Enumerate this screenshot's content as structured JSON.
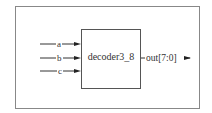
{
  "diagram": {
    "module": {
      "name": "decoder3_8"
    },
    "inputs": [
      {
        "label": "a"
      },
      {
        "label": "b"
      },
      {
        "label": "c"
      }
    ],
    "outputs": [
      {
        "label": "out[7:0]"
      }
    ],
    "colors": {
      "line": "#333333",
      "frame": "#888888",
      "background": "#ffffff"
    }
  }
}
